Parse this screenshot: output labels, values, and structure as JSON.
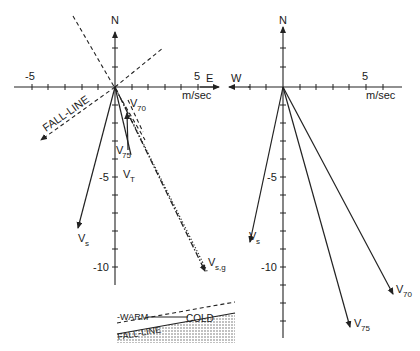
{
  "figure": {
    "units_label": "m/sec",
    "left_panel": {
      "north_label": "N",
      "east_label": "E",
      "x_tick_labels": [
        "-5",
        "5"
      ],
      "y_tick_labels": [
        "-5",
        "-10"
      ],
      "fall_line_label": "FALL-LINE",
      "vectors": [
        {
          "name": "V_s",
          "label": "V",
          "sub": "s",
          "style": "solid",
          "end": [
            -2.3,
            -7.9
          ]
        },
        {
          "name": "V_70",
          "label": "V",
          "sub": "70",
          "style": "solid",
          "end": [
            0.7,
            -1.4
          ]
        },
        {
          "name": "V_75",
          "label": "V",
          "sub": "75",
          "style": "solid",
          "end": [
            0.9,
            -3.8
          ]
        },
        {
          "name": "V_T",
          "label": "V",
          "sub": "T",
          "style": "dash-dot",
          "end": [
            5.4,
            -10.2
          ]
        },
        {
          "name": "V_s,g",
          "label": "V",
          "sub": "s,g",
          "style": "dotted",
          "end": [
            5.5,
            -10.3
          ]
        }
      ]
    },
    "right_panel": {
      "north_label": "N",
      "west_label": "W",
      "x_tick_labels": [
        "5"
      ],
      "y_tick_labels": [
        "-5",
        "-10"
      ],
      "vectors": [
        {
          "name": "V_s",
          "label": "V",
          "sub": "s",
          "end": [
            -2.3,
            -8.8
          ]
        },
        {
          "name": "V_75",
          "label": "V",
          "sub": "75",
          "end": [
            4.0,
            -13.3
          ]
        },
        {
          "name": "V_70",
          "label": "V",
          "sub": "70",
          "end": [
            6.6,
            -11.5
          ]
        }
      ]
    },
    "inset": {
      "warm_label": "-WARM",
      "cold_label": "COLD",
      "fall_line_label": "FALL-LINE"
    }
  }
}
